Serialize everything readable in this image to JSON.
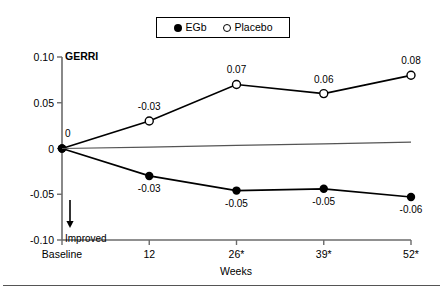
{
  "legend": {
    "entries": [
      {
        "label": "EGb",
        "marker": "filled-circle-icon",
        "color": "#000000"
      },
      {
        "label": "Placebo",
        "marker": "open-circle-icon",
        "color": "#000000"
      }
    ]
  },
  "annotations": {
    "improved_label": "Improved",
    "improved_arrow": "arrow-down-icon",
    "origin_value_label": "0"
  },
  "chart_data": {
    "type": "line",
    "title": "GERRI",
    "xlabel": "Weeks",
    "ylabel": "",
    "categories": [
      "Baseline",
      "12",
      "26*",
      "39*",
      "52*"
    ],
    "x": [
      0,
      12,
      26,
      39,
      52
    ],
    "ylim": [
      -0.1,
      0.1
    ],
    "yticks": [
      0.1,
      0.05,
      0,
      -0.05,
      -0.1
    ],
    "ytick_labels": [
      "0.10",
      "0.05",
      "0",
      "-0.05",
      "-0.10"
    ],
    "grid": false,
    "legend_position": "top-center",
    "series": [
      {
        "name": "Placebo",
        "marker": "open-circle",
        "color": "#000000",
        "values": [
          0,
          0.03,
          0.07,
          0.06,
          0.08
        ],
        "point_labels": [
          "",
          "-0.03",
          "0.07",
          "0.06",
          "0.08"
        ],
        "label_position": "above"
      },
      {
        "name": "EGb",
        "marker": "filled-circle",
        "color": "#000000",
        "values": [
          0,
          -0.03,
          -0.046,
          -0.044,
          -0.053
        ],
        "point_labels": [
          "",
          "-0.03",
          "-0.05",
          "-0.05",
          "-0.06"
        ],
        "label_position": "below"
      },
      {
        "name": "reference",
        "marker": "none",
        "color": "#555555",
        "values": [
          0,
          0.0015,
          0.0035,
          0.005,
          0.007
        ],
        "point_labels": [
          "",
          "",
          "",
          "",
          ""
        ],
        "label_position": "none"
      }
    ]
  }
}
